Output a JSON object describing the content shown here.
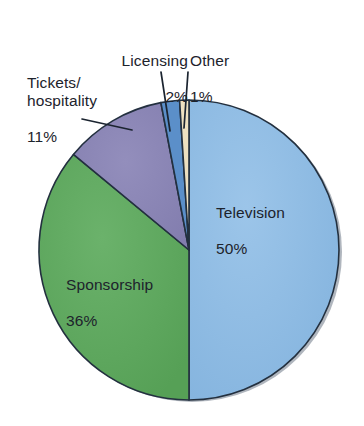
{
  "chart_data": {
    "type": "pie",
    "title": "",
    "subtitle": "",
    "xlabel": "",
    "ylabel": "",
    "legend_position": "none",
    "grid": false,
    "value_unit": "%",
    "total": 100,
    "categories": [
      "Television",
      "Sponsorship",
      "Tickets/\nhospitality",
      "Licensing",
      "Other"
    ],
    "values": [
      50,
      36,
      11,
      2,
      1
    ],
    "slices": [
      {
        "name": "Television",
        "label_name": "Television",
        "value": 50,
        "value_label": "50%",
        "color": "#8FBCE4",
        "label_placement": "inside",
        "start_angle_deg": 0,
        "end_angle_deg": 180
      },
      {
        "name": "Sponsorship",
        "label_name": "Sponsorship",
        "value": 36,
        "value_label": "36%",
        "color": "#5EA85E",
        "label_placement": "inside",
        "start_angle_deg": 180,
        "end_angle_deg": 309.6
      },
      {
        "name": "Tickets/hospitality",
        "label_name": "Tickets/\nhospitality",
        "value": 11,
        "value_label": "11%",
        "color": "#8A85B5",
        "label_placement": "outside-leader",
        "start_angle_deg": 309.6,
        "end_angle_deg": 349.2
      },
      {
        "name": "Licensing",
        "label_name": "Licensing",
        "value": 2,
        "value_label": "2%",
        "color": "#5B8FC9",
        "label_placement": "outside-leader",
        "start_angle_deg": 349.2,
        "end_angle_deg": 356.4
      },
      {
        "name": "Other",
        "label_name": "Other",
        "value": 1,
        "value_label": "1%",
        "color": "#EDE0C0",
        "label_placement": "outside-leader",
        "start_angle_deg": 356.4,
        "end_angle_deg": 360
      }
    ],
    "colors": {
      "television": "#8FBCE4",
      "sponsorship": "#5EA85E",
      "tickets_hospitality": "#8A85B5",
      "licensing": "#5B8FC9",
      "other": "#EDE0C0",
      "outline": "#23303f",
      "label_text": "#1d232c",
      "background": "#ffffff"
    }
  }
}
